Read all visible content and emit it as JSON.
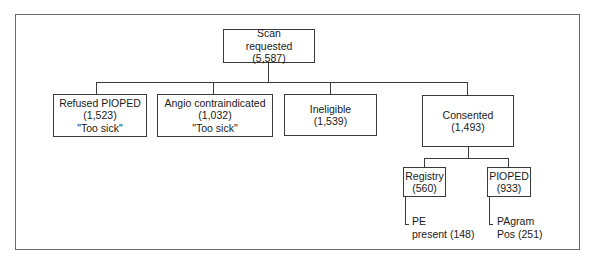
{
  "diagram": {
    "type": "flowchart-tree",
    "root": {
      "label_line1": "Scan",
      "label_line2": "requested",
      "count": "(5,587)"
    },
    "level1": [
      {
        "label": "Refused PIOPED",
        "count": "(1,523)",
        "note": "\"Too sick\""
      },
      {
        "label": "Angio contraindicated",
        "count": "(1,032)",
        "note": "\"Too sick\""
      },
      {
        "label": "Ineligible",
        "count": "(1,539)"
      },
      {
        "label": "Consented",
        "count": "(1,493)"
      }
    ],
    "level2": [
      {
        "label": "Registry",
        "count": "(560)"
      },
      {
        "label": "PIOPED",
        "count": "(933)"
      }
    ],
    "leaves": [
      {
        "line1": "PE",
        "line2": "present (148)"
      },
      {
        "line1": "PAgram",
        "line2": "Pos (251)"
      }
    ],
    "colors": {
      "frame": "#6a6a6a",
      "lines": "#3a3a3a",
      "text": "#1a1a1a",
      "background": "#ffffff"
    }
  }
}
